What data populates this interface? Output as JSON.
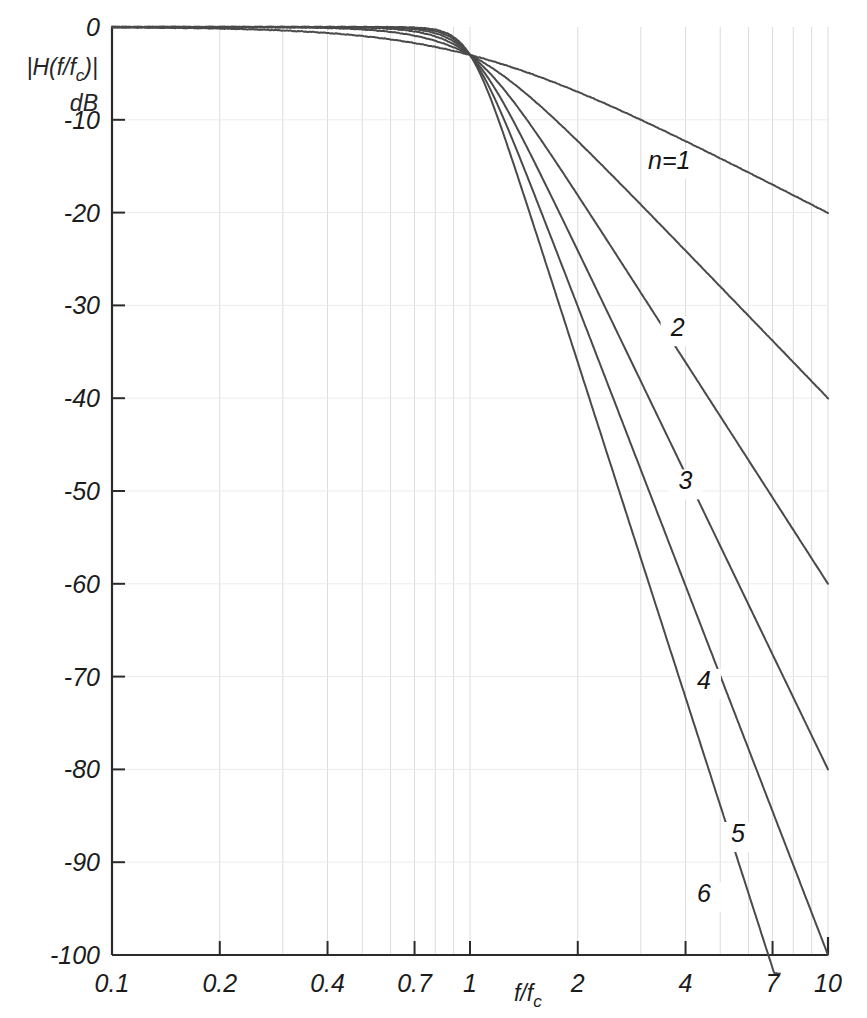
{
  "chart_data": {
    "type": "line",
    "title": "",
    "subtitle": "",
    "xlabel": "f/f_c",
    "xlabel_main": "f/f",
    "xlabel_sub": "c",
    "ylabel_line1": "|H(f/f",
    "ylabel_line1_sub": "c",
    "ylabel_line1_end": ")|",
    "ylabel_line2": "dB",
    "ylabel": "|H(f/f_c)| dB",
    "xscale": "log",
    "xlim": [
      0.1,
      10
    ],
    "ylim": [
      -100,
      0
    ],
    "grid": true,
    "legend_position": "inline-curve-labels",
    "xticks": [
      0.1,
      0.2,
      0.4,
      0.7,
      1,
      2,
      4,
      7,
      10
    ],
    "xticklabels": [
      "0.1",
      "0.2",
      "0.4",
      "0.7",
      "1",
      "2",
      "4",
      "7",
      "10"
    ],
    "yticks": [
      0,
      -10,
      -20,
      -30,
      -40,
      -50,
      -60,
      -70,
      -80,
      -90,
      -100
    ],
    "yticklabels": [
      "0",
      "-10",
      "-20",
      "-30",
      "-40",
      "-50",
      "-60",
      "-70",
      "-80",
      "-90",
      "-100"
    ],
    "xgridlines": [
      0.1,
      0.2,
      0.3,
      0.4,
      0.5,
      0.6,
      0.7,
      0.8,
      0.9,
      1,
      2,
      3,
      4,
      5,
      6,
      7,
      8,
      9,
      10
    ],
    "formula": "|H(f/fc)| = 1 / sqrt(1 + (f/fc)^(2n))",
    "series": [
      {
        "name": "n=1",
        "order": 1,
        "label": "n=1",
        "label_x": 3.6,
        "label_y": -15.0
      },
      {
        "name": "2",
        "order": 2,
        "label": "2",
        "label_x": 3.8,
        "label_y": -33.0
      },
      {
        "name": "3",
        "order": 3,
        "label": "3",
        "label_x": 4.0,
        "label_y": -49.5
      },
      {
        "name": "4",
        "order": 4,
        "label": "4",
        "label_x": 4.5,
        "label_y": -71.0
      },
      {
        "name": "5",
        "order": 5,
        "label": "5",
        "label_x": 5.6,
        "label_y": -87.5
      },
      {
        "name": "6",
        "order": 6,
        "label": "6",
        "label_x": 4.5,
        "label_y": -94.0
      }
    ],
    "sample_points": {
      "n=1": [
        [
          0.1,
          -0.04
        ],
        [
          0.2,
          -0.17
        ],
        [
          0.4,
          -0.64
        ],
        [
          0.7,
          -1.79
        ],
        [
          1,
          -3.01
        ],
        [
          2,
          -6.99
        ],
        [
          4,
          -12.3
        ],
        [
          7,
          -16.9
        ],
        [
          8,
          -18.1
        ]
      ],
      "n=2": [
        [
          0.1,
          0.0
        ],
        [
          0.2,
          -0.01
        ],
        [
          0.4,
          -0.11
        ],
        [
          0.7,
          -0.86
        ],
        [
          1,
          -3.01
        ],
        [
          2,
          -12.3
        ],
        [
          4,
          -24.1
        ],
        [
          7,
          -33.7
        ],
        [
          8,
          -36.1
        ]
      ],
      "n=3": [
        [
          0.1,
          0.0
        ],
        [
          0.2,
          0.0
        ],
        [
          0.4,
          -0.02
        ],
        [
          0.7,
          -0.4
        ],
        [
          1,
          -3.01
        ],
        [
          2,
          -18.1
        ],
        [
          4,
          -36.1
        ],
        [
          7,
          -50.6
        ],
        [
          8,
          -54.2
        ]
      ],
      "n=4": [
        [
          0.1,
          0.0
        ],
        [
          0.2,
          0.0
        ],
        [
          0.4,
          0.0
        ],
        [
          0.7,
          -0.18
        ],
        [
          1,
          -3.01
        ],
        [
          2,
          -24.1
        ],
        [
          4,
          -48.2
        ],
        [
          7,
          -67.5
        ],
        [
          8,
          -72.2
        ]
      ],
      "n=5": [
        [
          0.1,
          0.0
        ],
        [
          0.2,
          0.0
        ],
        [
          0.4,
          0.0
        ],
        [
          0.7,
          -0.08
        ],
        [
          1,
          -3.01
        ],
        [
          2,
          -30.1
        ],
        [
          4,
          -60.2
        ],
        [
          7,
          -84.4
        ],
        [
          8,
          -90.3
        ]
      ],
      "n=6": [
        [
          0.1,
          0.0
        ],
        [
          0.2,
          0.0
        ],
        [
          0.4,
          0.0
        ],
        [
          0.7,
          -0.04
        ],
        [
          1,
          -3.01
        ],
        [
          2,
          -36.1
        ],
        [
          4,
          -72.2
        ],
        [
          6.5,
          -88.0
        ],
        [
          7.2,
          -94.0
        ]
      ]
    }
  },
  "style": {
    "curve_color": "#4a4a4a",
    "axis_color": "#2b2b2b",
    "grid_color": "#dcdcdc",
    "background": "#ffffff",
    "text_color": "#1c1c1c"
  }
}
